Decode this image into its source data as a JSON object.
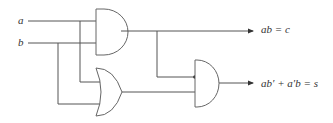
{
  "diagram": {
    "type": "logic-circuit",
    "inputs": [
      {
        "id": "a",
        "label": "a"
      },
      {
        "id": "b",
        "label": "b"
      }
    ],
    "gates": [
      {
        "id": "and1",
        "type": "AND",
        "inputs": [
          "a",
          "b"
        ],
        "output": "c"
      },
      {
        "id": "or1",
        "type": "OR",
        "inputs": [
          "a",
          "b"
        ]
      },
      {
        "id": "and2",
        "type": "AND",
        "inputs": [
          "and1",
          "or1"
        ],
        "output": "s"
      }
    ],
    "outputs": [
      {
        "id": "c",
        "label": "ab = c"
      },
      {
        "id": "s",
        "label": "ab′ + a′b = s"
      }
    ]
  }
}
